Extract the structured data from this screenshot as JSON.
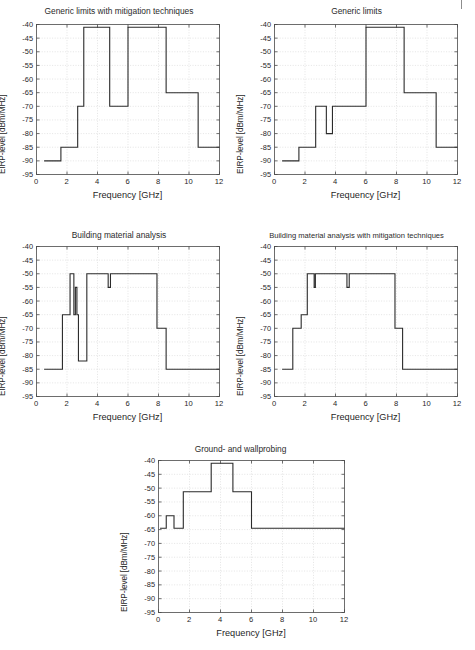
{
  "page": {
    "clipped_header_text": "",
    "background_color": "#ffffff",
    "line_color": "#2b2b2b",
    "grid_color": "#d2d2d2",
    "axis_color": "#4a4a4a"
  },
  "charts": [
    {
      "id": "generic-limits-with-mitigation-techniques",
      "title": "Generic limits with mitigation techniques",
      "xlabel": "Frequency [GHz]",
      "ylabel": "EIRP-level [dBm/MHz]",
      "xticks": [
        0,
        2,
        4,
        6,
        8,
        10,
        12
      ],
      "yticks": [
        -40,
        -45,
        -50,
        -55,
        -60,
        -65,
        -70,
        -75,
        -80,
        -85,
        -90,
        -95
      ],
      "xlim": [
        0,
        12
      ],
      "ylim": [
        -95,
        -40
      ],
      "steps": [
        {
          "x0": 0.5,
          "x1": 1.6,
          "y": -90
        },
        {
          "x0": 1.6,
          "x1": 2.7,
          "y": -85
        },
        {
          "x0": 2.7,
          "x1": 3.1,
          "y": -70
        },
        {
          "x0": 3.1,
          "x1": 4.8,
          "y": -41
        },
        {
          "x0": 4.8,
          "x1": 6.0,
          "y": -70
        },
        {
          "x0": 6.0,
          "x1": 8.5,
          "y": -41
        },
        {
          "x0": 8.5,
          "x1": 10.6,
          "y": -65
        },
        {
          "x0": 10.6,
          "x1": 12.0,
          "y": -85
        }
      ]
    },
    {
      "id": "generic-limits",
      "title": "Generic limits",
      "xlabel": "Frequency [GHz]",
      "ylabel": "EIRP-level [dBm/MHz]",
      "xticks": [
        0,
        2,
        4,
        6,
        8,
        10,
        12
      ],
      "yticks": [
        -40,
        -45,
        -50,
        -55,
        -60,
        -65,
        -70,
        -75,
        -80,
        -85,
        -90,
        -95
      ],
      "xlim": [
        0,
        12
      ],
      "ylim": [
        -95,
        -40
      ],
      "steps": [
        {
          "x0": 0.5,
          "x1": 1.6,
          "y": -90
        },
        {
          "x0": 1.6,
          "x1": 2.7,
          "y": -85
        },
        {
          "x0": 2.7,
          "x1": 3.4,
          "y": -70
        },
        {
          "x0": 3.4,
          "x1": 3.8,
          "y": -80
        },
        {
          "x0": 3.8,
          "x1": 6.0,
          "y": -70
        },
        {
          "x0": 6.0,
          "x1": 8.5,
          "y": -41
        },
        {
          "x0": 8.5,
          "x1": 10.6,
          "y": -65
        },
        {
          "x0": 10.6,
          "x1": 12.0,
          "y": -85
        }
      ]
    },
    {
      "id": "building-material-analysis",
      "title": "Building material analysis",
      "xlabel": "Frequency [GHz]",
      "ylabel": "EIRP-level [dBm/MHz]",
      "xticks": [
        0,
        2,
        4,
        6,
        8,
        10,
        12
      ],
      "yticks": [
        -40,
        -45,
        -50,
        -55,
        -60,
        -65,
        -70,
        -75,
        -80,
        -85,
        -90,
        -95
      ],
      "xlim": [
        0,
        12
      ],
      "ylim": [
        -95,
        -40
      ],
      "steps": [
        {
          "x0": 0.5,
          "x1": 1.7,
          "y": -85
        },
        {
          "x0": 1.7,
          "x1": 2.2,
          "y": -65
        },
        {
          "x0": 2.2,
          "x1": 2.45,
          "y": -50
        },
        {
          "x0": 2.45,
          "x1": 2.55,
          "y": -65
        },
        {
          "x0": 2.55,
          "x1": 2.65,
          "y": -55
        },
        {
          "x0": 2.65,
          "x1": 2.75,
          "y": -65
        },
        {
          "x0": 2.75,
          "x1": 3.3,
          "y": -82
        },
        {
          "x0": 3.3,
          "x1": 4.7,
          "y": -50
        },
        {
          "x0": 4.7,
          "x1": 4.85,
          "y": -55
        },
        {
          "x0": 4.85,
          "x1": 7.9,
          "y": -50
        },
        {
          "x0": 7.9,
          "x1": 8.5,
          "y": -70
        },
        {
          "x0": 8.5,
          "x1": 12.0,
          "y": -85
        }
      ]
    },
    {
      "id": "building-material-analysis-with-mitigation-techniques",
      "title": "Building material analysis with mitigation techniques",
      "xlabel": "Frequency [GHz]",
      "ylabel": "EIRP-level [dBm/MHz]",
      "xticks": [
        0,
        2,
        4,
        6,
        8,
        10,
        12
      ],
      "yticks": [
        -40,
        -45,
        -50,
        -55,
        -60,
        -65,
        -70,
        -75,
        -80,
        -85,
        -90,
        -95
      ],
      "xlim": [
        0,
        12
      ],
      "ylim": [
        -95,
        -40
      ],
      "steps": [
        {
          "x0": 0.5,
          "x1": 1.2,
          "y": -85
        },
        {
          "x0": 1.2,
          "x1": 1.75,
          "y": -70
        },
        {
          "x0": 1.75,
          "x1": 2.15,
          "y": -65
        },
        {
          "x0": 2.15,
          "x1": 2.6,
          "y": -50
        },
        {
          "x0": 2.6,
          "x1": 2.68,
          "y": -55
        },
        {
          "x0": 2.68,
          "x1": 4.75,
          "y": -50
        },
        {
          "x0": 4.75,
          "x1": 4.9,
          "y": -55
        },
        {
          "x0": 4.9,
          "x1": 7.9,
          "y": -50
        },
        {
          "x0": 7.9,
          "x1": 8.4,
          "y": -70
        },
        {
          "x0": 8.4,
          "x1": 12.0,
          "y": -85
        }
      ]
    },
    {
      "id": "ground-and-wallprobing",
      "title": "Ground- and wallprobing",
      "xlabel": "Frequency [GHz]",
      "ylabel": "EIRP-level [dBm/MHz]",
      "xticks": [
        0,
        2,
        4,
        6,
        8,
        10,
        12
      ],
      "yticks": [
        -40,
        -45,
        -50,
        -55,
        -60,
        -65,
        -70,
        -75,
        -80,
        -85,
        -90,
        -95
      ],
      "xlim": [
        0,
        12
      ],
      "ylim": [
        -95,
        -40
      ],
      "steps": [
        {
          "x0": 0.1,
          "x1": 0.5,
          "y": -64.5
        },
        {
          "x0": 0.5,
          "x1": 1.0,
          "y": -60
        },
        {
          "x0": 1.0,
          "x1": 1.6,
          "y": -64.5
        },
        {
          "x0": 1.6,
          "x1": 3.4,
          "y": -51.3
        },
        {
          "x0": 3.4,
          "x1": 4.8,
          "y": -41
        },
        {
          "x0": 4.8,
          "x1": 6.0,
          "y": -51.3
        },
        {
          "x0": 6.0,
          "x1": 12.0,
          "y": -64.5
        }
      ]
    }
  ],
  "chart_data": [
    {
      "type": "line",
      "title": "Generic limits with mitigation techniques",
      "xlabel": "Frequency [GHz]",
      "ylabel": "EIRP-level [dBm/MHz]",
      "xlim": [
        0,
        12
      ],
      "ylim": [
        -95,
        -40
      ],
      "grid": true,
      "legend": "none",
      "x": [
        0.5,
        1.6,
        1.6,
        2.7,
        2.7,
        3.1,
        3.1,
        4.8,
        4.8,
        6.0,
        6.0,
        8.5,
        8.5,
        10.6,
        10.6,
        12.0
      ],
      "y": [
        -90,
        -90,
        -85,
        -85,
        -70,
        -70,
        -41,
        -41,
        -70,
        -70,
        -41,
        -41,
        -65,
        -65,
        -85,
        -85
      ]
    },
    {
      "type": "line",
      "title": "Generic limits",
      "xlabel": "Frequency [GHz]",
      "ylabel": "EIRP-level [dBm/MHz]",
      "xlim": [
        0,
        12
      ],
      "ylim": [
        -95,
        -40
      ],
      "grid": true,
      "legend": "none",
      "x": [
        0.5,
        1.6,
        1.6,
        2.7,
        2.7,
        3.4,
        3.4,
        3.8,
        3.8,
        6.0,
        6.0,
        8.5,
        8.5,
        10.6,
        10.6,
        12.0
      ],
      "y": [
        -90,
        -90,
        -85,
        -85,
        -70,
        -70,
        -80,
        -80,
        -70,
        -70,
        -41,
        -41,
        -65,
        -65,
        -85,
        -85
      ]
    },
    {
      "type": "line",
      "title": "Building material analysis",
      "xlabel": "Frequency [GHz]",
      "ylabel": "EIRP-level [dBm/MHz]",
      "xlim": [
        0,
        12
      ],
      "ylim": [
        -95,
        -40
      ],
      "grid": true,
      "legend": "none",
      "x": [
        0.5,
        1.7,
        1.7,
        2.2,
        2.2,
        2.45,
        2.45,
        2.55,
        2.55,
        2.65,
        2.65,
        2.75,
        2.75,
        3.3,
        3.3,
        4.7,
        4.7,
        4.85,
        4.85,
        7.9,
        7.9,
        8.5,
        8.5,
        12.0
      ],
      "y": [
        -85,
        -85,
        -65,
        -65,
        -50,
        -50,
        -65,
        -65,
        -55,
        -55,
        -65,
        -65,
        -82,
        -82,
        -50,
        -50,
        -55,
        -55,
        -50,
        -50,
        -70,
        -70,
        -85,
        -85
      ]
    },
    {
      "type": "line",
      "title": "Building material analysis with mitigation techniques",
      "xlabel": "Frequency [GHz]",
      "ylabel": "EIRP-level [dBm/MHz]",
      "xlim": [
        0,
        12
      ],
      "ylim": [
        -95,
        -40
      ],
      "grid": true,
      "legend": "none",
      "x": [
        0.5,
        1.2,
        1.2,
        1.75,
        1.75,
        2.15,
        2.15,
        2.6,
        2.6,
        2.68,
        2.68,
        4.75,
        4.75,
        4.9,
        4.9,
        7.9,
        7.9,
        8.4,
        8.4,
        12.0
      ],
      "y": [
        -85,
        -85,
        -70,
        -70,
        -65,
        -65,
        -50,
        -50,
        -55,
        -55,
        -50,
        -50,
        -55,
        -55,
        -50,
        -50,
        -70,
        -70,
        -85,
        -85
      ]
    },
    {
      "type": "line",
      "title": "Ground- and wallprobing",
      "xlabel": "Frequency [GHz]",
      "ylabel": "EIRP-level [dBm/MHz]",
      "xlim": [
        0,
        12
      ],
      "ylim": [
        -95,
        -40
      ],
      "grid": true,
      "legend": "none",
      "x": [
        0.1,
        0.5,
        0.5,
        1.0,
        1.0,
        1.6,
        1.6,
        3.4,
        3.4,
        4.8,
        4.8,
        6.0,
        6.0,
        12.0
      ],
      "y": [
        -64.5,
        -64.5,
        -60,
        -60,
        -64.5,
        -64.5,
        -51.3,
        -51.3,
        -41,
        -41,
        -51.3,
        -51.3,
        -64.5,
        -64.5
      ]
    }
  ]
}
